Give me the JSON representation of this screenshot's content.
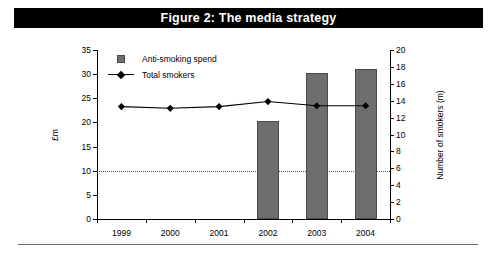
{
  "figure": {
    "title": "Figure 2: The media strategy"
  },
  "chart_data": {
    "type": "bar",
    "title": "Figure 2: The media strategy",
    "categories": [
      "1999",
      "2000",
      "2001",
      "2002",
      "2003",
      "2004"
    ],
    "xlabel": "",
    "series": [
      {
        "name": "Anti-smoking spend",
        "type": "bar",
        "axis": "left",
        "unit": "£m",
        "color": "#6e6e6e",
        "values": [
          0,
          0,
          0,
          20.2,
          30.3,
          31.0
        ]
      },
      {
        "name": "Total smokers",
        "type": "line",
        "axis": "right",
        "unit": "m",
        "color": "#000000",
        "marker": "diamond",
        "values": [
          13.3,
          13.1,
          13.3,
          13.9,
          13.4,
          13.4
        ]
      }
    ],
    "axes": {
      "left": {
        "label": "£m",
        "ticks": [
          "35",
          "30",
          "25",
          "20",
          "15",
          "10",
          "5",
          "0"
        ],
        "values": [
          35,
          30,
          25,
          20,
          15,
          10,
          5,
          0
        ],
        "ylim": [
          0,
          35
        ]
      },
      "right": {
        "label": "Number of smokers (m)",
        "ticks": [
          "20",
          "18",
          "16",
          "14",
          "12",
          "10",
          "8",
          "6",
          "4",
          "2",
          "0"
        ],
        "values": [
          20,
          18,
          16,
          14,
          12,
          10,
          8,
          6,
          4,
          2,
          0
        ],
        "ylim": [
          0,
          20
        ]
      }
    },
    "grid": {
      "horizontal_dotted_at_left_value": 10,
      "horizontal_dotted_at_right_value": 6
    },
    "legend": {
      "position": "top-left-inside",
      "entries": [
        {
          "label": "Anti-smoking spend",
          "marker": "square",
          "color": "#6e6e6e"
        },
        {
          "label": "Total smokers",
          "marker": "diamond-line",
          "color": "#000000"
        }
      ]
    }
  }
}
